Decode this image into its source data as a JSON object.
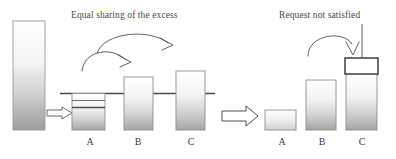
{
  "figure": {
    "type": "diagram",
    "title": "",
    "panels": [
      {
        "id": "left",
        "caption": "Equal sharing of the excess",
        "threshold_line": true,
        "bars": [
          {
            "label": "A",
            "state": "below-threshold",
            "sublines": 2
          },
          {
            "label": "B",
            "state": "above-threshold",
            "sublines": 0
          },
          {
            "label": "C",
            "state": "above-threshold",
            "sublines": 0
          }
        ],
        "source_bar": {
          "label": "",
          "state": "tall-source"
        },
        "flow_arrows": [
          "source-to-A",
          "A-to-B",
          "A-to-C"
        ]
      },
      {
        "id": "right",
        "caption": "Request not satisfied",
        "threshold_line": false,
        "bars": [
          {
            "label": "A",
            "state": "short",
            "sublines": 0
          },
          {
            "label": "B",
            "state": "medium",
            "sublines": 0
          },
          {
            "label": "C",
            "state": "tall-with-box",
            "sublines": 0
          }
        ],
        "flow_arrows": [
          "curve-to-C"
        ],
        "pointer_line": true,
        "empty_box_on_C": true
      }
    ],
    "transition_arrow": "left-panel-to-right-panel",
    "colors": {
      "bar_stroke": "#8c8c8c",
      "bar_fill_top": "#ffffff",
      "bar_fill_bottom": "#a8a8a8",
      "line": "#555555",
      "text": "#434343",
      "background": "#ffffff"
    }
  },
  "captions": {
    "left": "Equal sharing of the excess",
    "right": "Request not satisfied"
  },
  "labels": {
    "left": [
      "A",
      "B",
      "C"
    ],
    "right": [
      "A",
      "B",
      "C"
    ]
  }
}
